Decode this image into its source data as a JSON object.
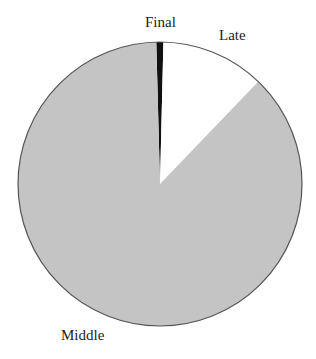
{
  "chart_data": {
    "type": "pie",
    "title": "",
    "categories": [
      "Final",
      "Late",
      "Middle"
    ],
    "values": [
      0.8,
      11.8,
      87.4
    ],
    "colors": [
      "#111111",
      "#ffffff",
      "#c4c4c4"
    ],
    "start_angle_deg": -1.5,
    "direction": "clockwise",
    "legend": "none",
    "labels_outside": true
  },
  "geometry": {
    "cx": 160,
    "cy": 184,
    "r": 142,
    "stroke": "#555555"
  },
  "labels": [
    {
      "text": "Final",
      "x": 145,
      "y": 14
    },
    {
      "text": "Late",
      "x": 219,
      "y": 27
    },
    {
      "text": "Middle",
      "x": 61,
      "y": 327
    }
  ]
}
